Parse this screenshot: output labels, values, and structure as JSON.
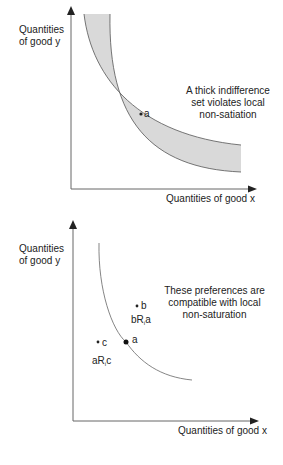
{
  "top_panel": {
    "y_axis_label_line1": "Quantities",
    "y_axis_label_line2": "of good y",
    "x_axis_label": "Quantities of good x",
    "annotation_line1": "A thick indifference",
    "annotation_line2": "set violates local",
    "annotation_line3": "non-satiation",
    "point_a_label": "a",
    "band_fill_color": "#d9d9d9",
    "line_color": "#555555"
  },
  "bottom_panel": {
    "y_axis_label_line1": "Quantities",
    "y_axis_label_line2": "of good y",
    "x_axis_label": "Quantities of good x",
    "annotation_line1": "These preferences are",
    "annotation_line2": "compatible with local",
    "annotation_line3": "non-saturation",
    "point_a_label": "a",
    "point_b_label": "b",
    "point_c_label": "c",
    "relation_b_prefix": "bR",
    "relation_b_sub": "i",
    "relation_b_suffix": "a",
    "relation_a_prefix": "aR",
    "relation_a_sub": "i",
    "relation_a_suffix": "c"
  }
}
